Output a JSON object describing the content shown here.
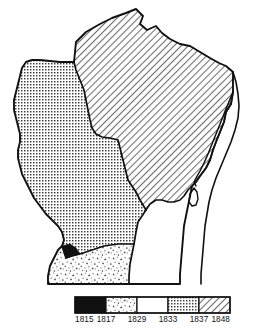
{
  "map": {
    "name": "Wisconsin",
    "regions": [
      {
        "id": "region-1815",
        "label": "1815",
        "pattern": "solid-black",
        "position": "southwest-corner-small-wedge"
      },
      {
        "id": "region-1817",
        "label": "1817",
        "pattern": "stipple-speckle",
        "position": "south-central"
      },
      {
        "id": "region-1829",
        "label": "1829",
        "pattern": "white-blank",
        "position": "southeast"
      },
      {
        "id": "region-1833",
        "label": "1833",
        "pattern": "dot-grid",
        "position": "west-and-central"
      },
      {
        "id": "region-1848",
        "label": "1848",
        "pattern": "diagonal-hatch",
        "position": "north-and-northeast"
      }
    ],
    "water_features": [
      {
        "id": "lake-michigan",
        "label": ""
      },
      {
        "id": "green-bay",
        "label": ""
      },
      {
        "id": "door-peninsula",
        "label": ""
      }
    ]
  },
  "legend": {
    "swatches": [
      {
        "pattern": "solid-black",
        "start_label": "1815"
      },
      {
        "pattern": "stipple-speckle",
        "start_label": "1817"
      },
      {
        "pattern": "white-blank",
        "start_label": "1829"
      },
      {
        "pattern": "dot-grid",
        "start_label": "1833"
      },
      {
        "pattern": "diagonal-hatch",
        "start_label": "1837"
      }
    ],
    "tick_labels": [
      "1815",
      "1817",
      "1829",
      "1833",
      "1837",
      "1848"
    ],
    "ticks": {
      "t0": "1815",
      "t1": "1817",
      "t2": "1829",
      "t3": "1833",
      "t4": "1837",
      "t5": "1848"
    }
  },
  "colors": {
    "ink": "#111111",
    "paper": "#ffffff",
    "pattern_gray": "#5a5a5a"
  }
}
